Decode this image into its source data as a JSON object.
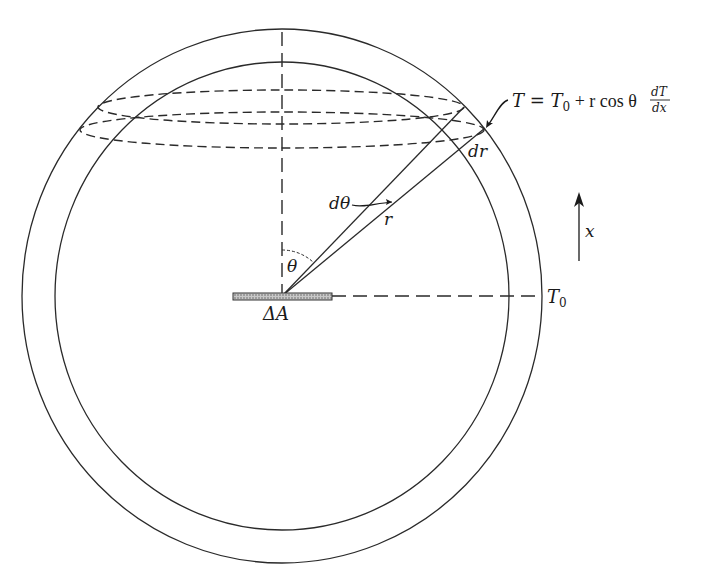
{
  "figure": {
    "type": "physics-diagram",
    "colors": {
      "line": "#2a2a2a",
      "background": "#ffffff",
      "hatch": "#8a8a8a"
    }
  },
  "labels": {
    "equation_lhs": "T = T",
    "equation_sub": "0",
    "equation_mid": " + r cos θ ",
    "equation_frac_num": "dT",
    "equation_frac_den": "dx",
    "dr": "dr",
    "dtheta": "dθ",
    "r": "r",
    "theta": "θ",
    "delta_a": "ΔA",
    "t0_main": "T",
    "t0_sub": "0",
    "x_axis": "x"
  },
  "geometry": {
    "outer_shell": {
      "cx": 282,
      "cy": 296,
      "rx": 260,
      "ry": 267
    },
    "inner_shell": {
      "cx": 282,
      "cy": 296,
      "rx": 227,
      "ry": 234
    },
    "upper_ring_ellipse": {
      "cx": 281,
      "cy": 107,
      "rx": 183,
      "ry": 17
    },
    "lower_ring_ellipse": {
      "cx": 282,
      "cy": 130,
      "rx": 202,
      "ry": 18
    },
    "origin": {
      "x": 282,
      "y": 296
    }
  }
}
